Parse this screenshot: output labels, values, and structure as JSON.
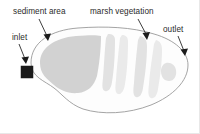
{
  "figure": {
    "background_color": "#ffffff",
    "width": 200,
    "height": 134
  },
  "labels": {
    "sediment_area": "sediment area",
    "marsh_vegetation": "marsh vegetation",
    "inlet": "inlet",
    "outlet": "outlet"
  },
  "colors": {
    "pond_fill": "#fdfdfd",
    "pond_outline": "#9a9a9a",
    "halo": "#f4f4f4",
    "sediment_fill": "#d2d2d2",
    "marsh_fill": "#e2e2e2",
    "marsh_soft_fill": "#eaeaea",
    "inlet_marker": "#1a1a1a",
    "leader_line": "#1c1c1c",
    "text": "#2b2b2b"
  },
  "features": {
    "inlet_marker_shape": "filled-square",
    "outlet_marker_shape": "small-blob",
    "pond_shape": "kidney-lobed-basin",
    "sediment_region": "forebay at inlet end",
    "marsh_bands": 4
  }
}
